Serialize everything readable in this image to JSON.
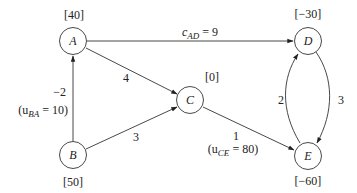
{
  "diagram": {
    "type": "network-flow-graph",
    "nodes": [
      {
        "id": "A",
        "label": "A",
        "supply": "[40]"
      },
      {
        "id": "B",
        "label": "B",
        "supply": "[50]"
      },
      {
        "id": "C",
        "label": "C",
        "supply": "[0]"
      },
      {
        "id": "D",
        "label": "D",
        "supply": "[−30]"
      },
      {
        "id": "E",
        "label": "E",
        "supply": "[−60]"
      }
    ],
    "edges": [
      {
        "from": "A",
        "to": "D",
        "cost": "9",
        "cost_label_prefix": "c",
        "cost_label_sub": "AD",
        "cost_label_suffix": " = 9"
      },
      {
        "from": "A",
        "to": "C",
        "cost": "4"
      },
      {
        "from": "B",
        "to": "A",
        "cost": "−2",
        "capacity_prefix": "(u",
        "capacity_sub": "BA",
        "capacity_suffix": " = 10)"
      },
      {
        "from": "B",
        "to": "C",
        "cost": "3"
      },
      {
        "from": "C",
        "to": "E",
        "cost": "1",
        "capacity_prefix": "(u",
        "capacity_sub": "CE",
        "capacity_suffix": " = 80)"
      },
      {
        "from": "E",
        "to": "D",
        "cost": "2"
      },
      {
        "from": "D",
        "to": "E",
        "cost": "3"
      }
    ]
  }
}
